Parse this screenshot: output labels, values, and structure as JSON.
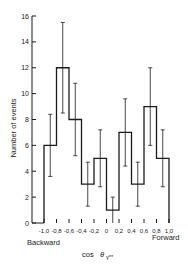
{
  "chart_data": {
    "type": "bar",
    "subtype": "histogram-with-error-bars",
    "title": "",
    "xlabel": "cos θγ**",
    "ylabel": "Number of events",
    "x_annotations": {
      "left": "Backward",
      "right": "Forward"
    },
    "bin_edges": [
      -1.0,
      -0.8,
      -0.6,
      -0.4,
      -0.2,
      0,
      0.2,
      0.4,
      0.6,
      0.8,
      1.0
    ],
    "categories": [
      "-1.0 to -0.8",
      "-0.8 to -0.6",
      "-0.6 to -0.4",
      "-0.4 to -0.2",
      "-0.2 to 0",
      "0 to 0.2",
      "0.2 to 0.4",
      "0.4 to 0.6",
      "0.6 to 0.8",
      "0.8 to 1.0"
    ],
    "values": [
      6,
      12,
      8,
      3,
      5,
      1,
      7,
      3,
      9,
      5
    ],
    "error_low": [
      3.6,
      8.5,
      5.2,
      1.3,
      2.8,
      0,
      4.4,
      1.3,
      6.0,
      2.8
    ],
    "error_high": [
      8.4,
      15.5,
      10.8,
      4.7,
      7.2,
      2.0,
      9.6,
      4.7,
      12.0,
      7.2
    ],
    "xticks": [
      "-1.0",
      "-0.8",
      "-0.6",
      "-0.4",
      "-0.2",
      "0",
      "0.2",
      "0.4",
      "0.6",
      "0.8",
      "1.0"
    ],
    "yticks": [
      0,
      2,
      4,
      6,
      8,
      10,
      12,
      14,
      16
    ],
    "xlim": [
      -1.0,
      1.0
    ],
    "ylim": [
      0,
      16
    ],
    "grid": false,
    "legend": null
  },
  "labels": {
    "ylabel": "Number of events",
    "xlabel_prefix": "cos",
    "xlabel_symbol": "θ",
    "xlabel_sub": "γ**",
    "backward": "Backward",
    "forward": "Forward",
    "xticks_text": "-1.0 0.8-0.6-0.4-0.2  0  0.2 0.4 0.6 0.8 1.0"
  }
}
